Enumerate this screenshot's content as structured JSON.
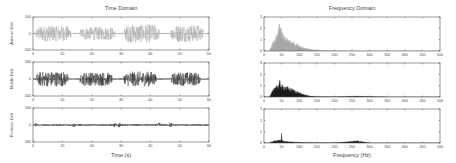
{
  "figure": {
    "left_title": "Time Domain",
    "right_title": "Frequency Domain",
    "left_xlabel": "Time (s)",
    "right_xlabel": "Frequency (Hz)"
  },
  "chart_data": [
    {
      "type": "line",
      "title": "Time Domain",
      "xlabel": "",
      "ylabel": "Anterior Delt",
      "xlim": [
        0,
        60
      ],
      "ylim": [
        -500,
        500
      ],
      "xticks": [
        0,
        10,
        20,
        30,
        40,
        50,
        60
      ],
      "yticks": [
        -500,
        0,
        500
      ],
      "color": "#a8a8a8",
      "bursts": [
        {
          "start": 1,
          "end": 13,
          "amplitude": 240
        },
        {
          "start": 16,
          "end": 28,
          "amplitude": 200
        },
        {
          "start": 31,
          "end": 43,
          "amplitude": 280
        },
        {
          "start": 47,
          "end": 58,
          "amplitude": 260
        }
      ],
      "baseline_amplitude": 20
    },
    {
      "type": "line",
      "title": "",
      "xlabel": "",
      "ylabel": "Middle Delt",
      "xlim": [
        0,
        60
      ],
      "ylim": [
        -500,
        500
      ],
      "xticks": [
        0,
        10,
        20,
        30,
        40,
        50,
        60
      ],
      "yticks": [
        -500,
        0,
        500
      ],
      "color": "#2a2a2a",
      "bursts": [
        {
          "start": 1,
          "end": 12,
          "amplitude": 220
        },
        {
          "start": 16,
          "end": 27,
          "amplitude": 200
        },
        {
          "start": 31,
          "end": 42,
          "amplitude": 220
        },
        {
          "start": 47,
          "end": 57,
          "amplitude": 200
        }
      ],
      "baseline_amplitude": 15
    },
    {
      "type": "line",
      "title": "",
      "xlabel": "Time (s)",
      "ylabel": "Posterior Delt",
      "xlim": [
        0,
        60
      ],
      "ylim": [
        -500,
        500
      ],
      "xticks": [
        0,
        10,
        20,
        30,
        40,
        50,
        60
      ],
      "yticks": [
        -500,
        0,
        500
      ],
      "color": "#333333",
      "bursts": [
        {
          "start": 0,
          "end": 60,
          "amplitude": 25
        }
      ],
      "spikes": [
        1,
        14,
        28,
        29.5,
        43,
        47
      ],
      "baseline_amplitude": 20
    },
    {
      "type": "area",
      "title": "Frequency Domain",
      "xlabel": "",
      "ylabel": "",
      "xlim": [
        0,
        500
      ],
      "ylim": [
        0,
        3
      ],
      "xticks": [
        0,
        50,
        100,
        150,
        200,
        250,
        300,
        350,
        400,
        450,
        500
      ],
      "yticks": [
        0,
        1,
        2,
        3
      ],
      "color": "#a8a8a8",
      "x": [
        15,
        20,
        30,
        40,
        45,
        50,
        60,
        70,
        80,
        90,
        100,
        110,
        120,
        130,
        140,
        150,
        175,
        200,
        250,
        300,
        500
      ],
      "values": [
        0,
        0.4,
        1.0,
        1.6,
        2.8,
        1.7,
        1.2,
        1.0,
        0.85,
        0.7,
        0.5,
        0.35,
        0.25,
        0.18,
        0.12,
        0.08,
        0.04,
        0.02,
        0.01,
        0.005,
        0
      ]
    },
    {
      "type": "area",
      "title": "",
      "xlabel": "",
      "ylabel": "",
      "xlim": [
        0,
        500
      ],
      "ylim": [
        0,
        3
      ],
      "xticks": [
        0,
        50,
        100,
        150,
        200,
        250,
        300,
        350,
        400,
        450,
        500
      ],
      "yticks": [
        0,
        1,
        2,
        3
      ],
      "color": "#1a1a1a",
      "x": [
        15,
        20,
        30,
        35,
        40,
        45,
        50,
        60,
        70,
        80,
        90,
        100,
        110,
        120,
        130,
        140,
        150,
        200,
        265,
        350,
        500
      ],
      "values": [
        0,
        0.3,
        0.8,
        1.2,
        1.0,
        1.4,
        1.0,
        0.95,
        0.8,
        0.7,
        0.55,
        0.4,
        0.28,
        0.18,
        0.1,
        0.06,
        0.04,
        0.02,
        0.08,
        0.01,
        0
      ]
    },
    {
      "type": "area",
      "title": "",
      "xlabel": "Frequency (Hz)",
      "ylabel": "",
      "xlim": [
        0,
        500
      ],
      "ylim": [
        0,
        3
      ],
      "xticks": [
        0,
        50,
        100,
        150,
        200,
        250,
        300,
        350,
        400,
        450,
        500
      ],
      "yticks": [
        0,
        1,
        2,
        3
      ],
      "color": "#1a1a1a",
      "x": [
        15,
        20,
        30,
        40,
        48,
        50,
        52,
        60,
        80,
        100,
        150,
        200,
        265,
        300,
        500
      ],
      "values": [
        0,
        0.1,
        0.2,
        0.25,
        0.25,
        0.95,
        0.2,
        0.15,
        0.1,
        0.06,
        0.03,
        0.02,
        0.2,
        0.01,
        0
      ]
    }
  ]
}
